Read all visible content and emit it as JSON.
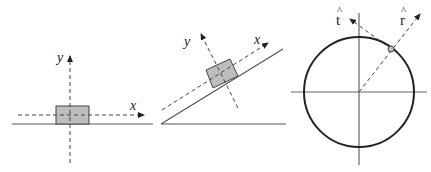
{
  "figure": {
    "panels": [
      {
        "id": "flat-surface",
        "axis_labels": {
          "x": "x",
          "y": "y"
        }
      },
      {
        "id": "inclined-plane",
        "axis_labels": {
          "x": "x",
          "y": "y"
        }
      },
      {
        "id": "circular-motion",
        "unit_vectors": {
          "tangential": "t",
          "radial": "r",
          "hat": "^"
        }
      }
    ]
  },
  "colors": {
    "line": "#555555",
    "block_fill": "#bdbdbd",
    "circle": "#222222",
    "background": "#ffffff"
  }
}
